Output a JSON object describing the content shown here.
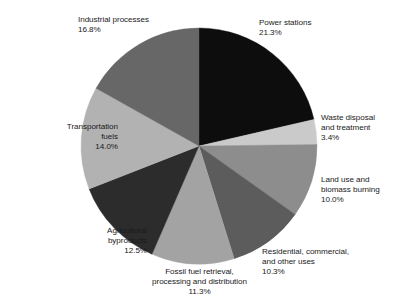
{
  "chart_data": {
    "type": "pie",
    "title": "",
    "subtitle": "",
    "xlabel": "",
    "ylabel": "",
    "legend_position": "none",
    "grid": false,
    "units": "percent",
    "total": 99.6,
    "start_angle_deg": 0,
    "direction": "clockwise",
    "categories": [
      "Power stations",
      "Waste disposal and treatment",
      "Land use and biomass burning",
      "Residential, commercial, and other uses",
      "Fossil fuel retrieval, processing and distribution",
      "Agricultural byproducts",
      "Transportation fuels",
      "Industrial processes"
    ],
    "values": [
      21.3,
      3.4,
      10.0,
      10.3,
      11.3,
      12.5,
      14.0,
      16.8
    ],
    "colors": [
      "#0d0d0d",
      "#cacaca",
      "#8d8d8d",
      "#5c5c5c",
      "#a3a3a3",
      "#2c2c2c",
      "#b2b2b2",
      "#676767"
    ],
    "slices": [
      {
        "label": "Power stations",
        "value": 21.3,
        "value_text": "21.3%",
        "color": "#0d0d0d"
      },
      {
        "label": "Waste disposal and treatment",
        "value": 3.4,
        "value_text": "3.4%",
        "color": "#cacaca"
      },
      {
        "label": "Land use and biomass burning",
        "value": 10.0,
        "value_text": "10.0%",
        "color": "#8d8d8d"
      },
      {
        "label": "Residential, commercial, and other uses",
        "value": 10.3,
        "value_text": "10.3%",
        "color": "#5c5c5c"
      },
      {
        "label": "Fossil fuel retrieval, processing and distribution",
        "value": 11.3,
        "value_text": "11.3%",
        "color": "#a3a3a3"
      },
      {
        "label": "Agricultural byproducts",
        "value": 12.5,
        "value_text": "12.5%",
        "color": "#2c2c2c"
      },
      {
        "label": "Transportation fuels",
        "value": 14.0,
        "value_text": "14.0%",
        "color": "#b2b2b2"
      },
      {
        "label": "Industrial processes",
        "value": 16.8,
        "value_text": "16.8%",
        "color": "#676767"
      }
    ]
  },
  "labels": {
    "power_stations": {
      "line1": "Power stations",
      "line2": "21.3%"
    },
    "waste_disposal": {
      "line1": "Waste disposal",
      "line2": "and treatment",
      "line3": "3.4%"
    },
    "land_use": {
      "line1": "Land use and",
      "line2": "biomass burning",
      "line3": "10.0%"
    },
    "residential": {
      "line1": "Residential, commercial,",
      "line2": "and other uses",
      "line3": "10.3%"
    },
    "fossil_fuel": {
      "line1": "Fossil fuel retrieval,",
      "line2": "processing and distribution",
      "line3": "11.3%"
    },
    "agricultural": {
      "line1": "Agricultural",
      "line2": "byproducts",
      "line3": "12.5%"
    },
    "transportation": {
      "line1": "Transportation",
      "line2": "fuels",
      "line3": "14.0%"
    },
    "industrial": {
      "line1": "Industrial processes",
      "line2": "16.8%"
    }
  },
  "geometry": {
    "center_x": 199,
    "center_y": 146,
    "radius": 118
  }
}
